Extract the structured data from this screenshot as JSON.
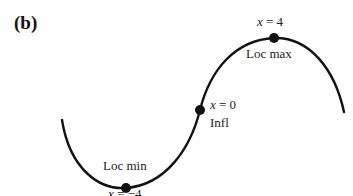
{
  "panel_label": "(b)",
  "points": {
    "max": {
      "x_label_var": "x",
      "x_label_rest": " = 4",
      "desc": "Loc max"
    },
    "inflection": {
      "x_label_var": "x",
      "x_label_rest": " = 0",
      "desc": "Infl"
    },
    "min": {
      "x_label_var": "x",
      "x_label_rest": " = −4",
      "desc": "Loc min"
    }
  },
  "colors": {
    "curve": "#111111",
    "text": "#222222"
  }
}
